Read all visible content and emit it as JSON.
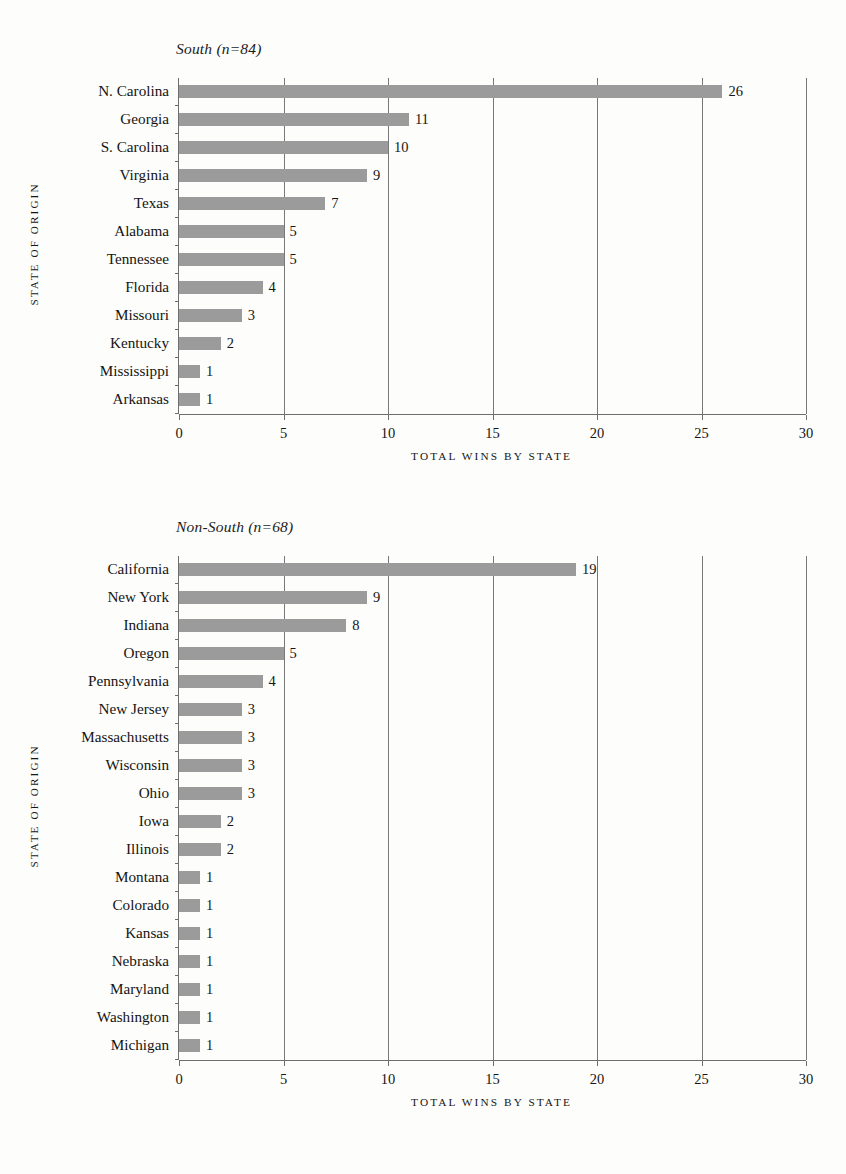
{
  "axis_titles": {
    "x": "TOTAL WINS BY STATE",
    "y": "STATE OF ORIGIN"
  },
  "colors": {
    "bar": "#9b9b9b",
    "axis": "#6e6e6e",
    "grid": "#787878",
    "text": "#161616",
    "background": "#fdfdfb"
  },
  "chart_data": [
    {
      "type": "bar",
      "orientation": "horizontal",
      "id": "south",
      "title": "South (n=84)",
      "xlabel": "TOTAL WINS BY STATE",
      "ylabel": "STATE OF ORIGIN",
      "xlim": [
        0,
        30
      ],
      "xticks": [
        0,
        5,
        10,
        15,
        20,
        25,
        30
      ],
      "xtick_labels": [
        "0",
        "5",
        "10",
        "15",
        "20",
        "25",
        "30"
      ],
      "grid": "vertical",
      "legend": "none",
      "categories": [
        "N. Carolina",
        "Georgia",
        "S. Carolina",
        "Virginia",
        "Texas",
        "Alabama",
        "Tennessee",
        "Florida",
        "Missouri",
        "Kentucky",
        "Mississippi",
        "Arkansas"
      ],
      "values": [
        26,
        11,
        10,
        9,
        7,
        5,
        5,
        4,
        3,
        2,
        1,
        1
      ],
      "value_labels": [
        "26",
        "11",
        "10",
        "9",
        "7",
        "5",
        "5",
        "4",
        "3",
        "2",
        "1",
        "1"
      ]
    },
    {
      "type": "bar",
      "orientation": "horizontal",
      "id": "nonsouth",
      "title": "Non-South (n=68)",
      "xlabel": "TOTAL WINS BY STATE",
      "ylabel": "STATE OF ORIGIN",
      "xlim": [
        0,
        30
      ],
      "xticks": [
        0,
        5,
        10,
        15,
        20,
        25,
        30
      ],
      "xtick_labels": [
        "0",
        "5",
        "10",
        "15",
        "20",
        "25",
        "30"
      ],
      "grid": "vertical",
      "legend": "none",
      "categories": [
        "California",
        "New York",
        "Indiana",
        "Oregon",
        "Pennsylvania",
        "New Jersey",
        "Massachusetts",
        "Wisconsin",
        "Ohio",
        "Iowa",
        "Illinois",
        "Montana",
        "Colorado",
        "Kansas",
        "Nebraska",
        "Maryland",
        "Washington",
        "Michigan"
      ],
      "values": [
        19,
        9,
        8,
        5,
        4,
        3,
        3,
        3,
        3,
        2,
        2,
        1,
        1,
        1,
        1,
        1,
        1,
        1
      ],
      "value_labels": [
        "19",
        "9",
        "8",
        "5",
        "4",
        "3",
        "3",
        "3",
        "3",
        "2",
        "2",
        "1",
        "1",
        "1",
        "1",
        "1",
        "1",
        "1"
      ]
    }
  ]
}
